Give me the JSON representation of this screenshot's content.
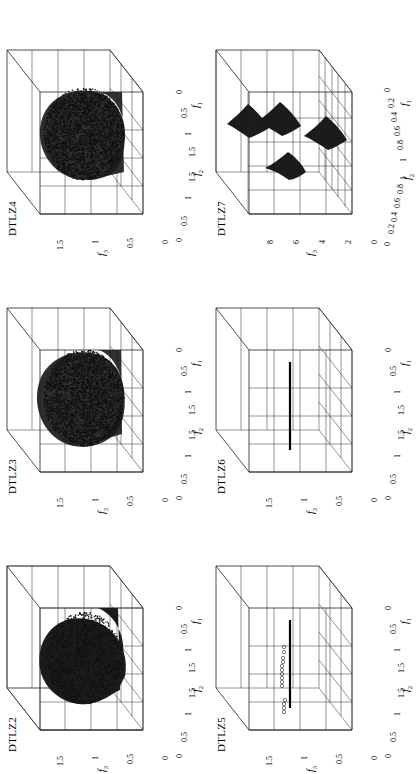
{
  "figure": {
    "layout": "2 rows x 3 columns of 3D scatter panels",
    "background": "#ffffff",
    "ink_color": "#111111"
  },
  "panels": [
    {
      "id": "dtlz2",
      "title": "DTLZ2",
      "row": 0,
      "col": 0,
      "axes": {
        "x": {
          "label": "f",
          "sub": "1",
          "ticks": [
            "0",
            "0.5",
            "1",
            "1.5"
          ],
          "range": [
            0,
            1.5
          ]
        },
        "y": {
          "label": "f",
          "sub": "2",
          "ticks": [
            "0",
            "0.5",
            "1",
            "1.5"
          ],
          "range": [
            0,
            1.5
          ]
        },
        "z": {
          "label": "f",
          "sub": "3",
          "ticks": [
            "0",
            "0.5",
            "1",
            "1.5"
          ],
          "range": [
            0,
            1.5
          ]
        }
      },
      "content": "dense-filled-spherical-front"
    },
    {
      "id": "dtlz3",
      "title": "DTLZ3",
      "row": 0,
      "col": 1,
      "axes": {
        "x": {
          "label": "f",
          "sub": "1",
          "ticks": [
            "0",
            "0.5",
            "1",
            "1.5"
          ],
          "range": [
            0,
            1.5
          ]
        },
        "y": {
          "label": "f",
          "sub": "2",
          "ticks": [
            "0",
            "0.5",
            "1",
            "1.5"
          ],
          "range": [
            0,
            1.5
          ]
        },
        "z": {
          "label": "f",
          "sub": "3",
          "ticks": [
            "0",
            "0.5",
            "1",
            "1.5"
          ],
          "range": [
            0,
            1.5
          ]
        }
      },
      "content": "scattered-spherical-front"
    },
    {
      "id": "dtlz4",
      "title": "DTLZ4",
      "row": 0,
      "col": 2,
      "axes": {
        "x": {
          "label": "f",
          "sub": "1",
          "ticks": [
            "0",
            "0.5",
            "1",
            "1.5"
          ],
          "range": [
            0,
            1.5
          ]
        },
        "y": {
          "label": "f",
          "sub": "2",
          "ticks": [
            "0",
            "0.5",
            "1",
            "1.5"
          ],
          "range": [
            0,
            1.5
          ]
        },
        "z": {
          "label": "f",
          "sub": "3",
          "ticks": [
            "0",
            "0.5",
            "1",
            "1.5"
          ],
          "range": [
            0,
            1.5
          ]
        }
      },
      "content": "scattered-spherical-front"
    },
    {
      "id": "dtlz5",
      "title": "DTLZ5",
      "row": 1,
      "col": 0,
      "axes": {
        "x": {
          "label": "f",
          "sub": "1",
          "ticks": [
            "0",
            "0.5",
            "1",
            "1.5"
          ],
          "range": [
            0,
            1.5
          ]
        },
        "y": {
          "label": "f",
          "sub": "2",
          "ticks": [
            "0",
            "0.5",
            "1",
            "1.5"
          ],
          "range": [
            0,
            1.5
          ]
        },
        "z": {
          "label": "f",
          "sub": "3",
          "ticks": [
            "0",
            "0.5",
            "1",
            "1.5"
          ],
          "range": [
            0,
            1.5
          ]
        }
      },
      "content": "degenerate-curve-plus-outlier-circles"
    },
    {
      "id": "dtlz6",
      "title": "DTLZ6",
      "row": 1,
      "col": 1,
      "axes": {
        "x": {
          "label": "f",
          "sub": "1",
          "ticks": [
            "0",
            "0.5",
            "1",
            "1.5"
          ],
          "range": [
            0,
            1.5
          ]
        },
        "y": {
          "label": "f",
          "sub": "2",
          "ticks": [
            "0",
            "0.5",
            "1",
            "1.5"
          ],
          "range": [
            0,
            1.5
          ]
        },
        "z": {
          "label": "f",
          "sub": "3",
          "ticks": [
            "0",
            "0.5",
            "1",
            "1.5"
          ],
          "range": [
            0,
            1.5
          ]
        }
      },
      "content": "degenerate-curve"
    },
    {
      "id": "dtlz7",
      "title": "DTLZ7",
      "row": 1,
      "col": 2,
      "axes": {
        "x": {
          "label": "f",
          "sub": "1",
          "ticks": [
            "0",
            "0.2",
            "0.4",
            "0.6",
            "0.8",
            "1"
          ],
          "range": [
            0,
            1
          ]
        },
        "y": {
          "label": "f",
          "sub": "2",
          "ticks": [
            "0",
            "0.2",
            "0.4",
            "0.6",
            "0.8",
            "1"
          ],
          "range": [
            0,
            1
          ]
        },
        "z": {
          "label": "f",
          "sub": "3",
          "ticks": [
            "0",
            "2",
            "4",
            "6",
            "8"
          ],
          "range": [
            0,
            8
          ]
        }
      },
      "content": "four-disconnected-patches"
    }
  ],
  "chart_data": {
    "type": "scatter",
    "title": "",
    "subplots": [
      {
        "name": "DTLZ2",
        "xlabel": "f1",
        "ylabel": "f2",
        "zlabel": "f3",
        "xlim": [
          0,
          1.5
        ],
        "ylim": [
          0,
          1.5
        ],
        "zlim": [
          0,
          1.5
        ],
        "xticks": [
          0,
          0.5,
          1,
          1.5
        ],
        "yticks": [
          0,
          0.5,
          1,
          1.5
        ],
        "zticks": [
          0,
          0.5,
          1,
          1.5
        ],
        "description": "Dense, solid-filled concave spherical Pareto front (unit octant sphere radius 1), points fully cover surface appearing as a solid black shell.",
        "point_count_estimate": 10000,
        "grid": true,
        "marker": "o"
      },
      {
        "name": "DTLZ3",
        "xlabel": "f1",
        "ylabel": "f2",
        "zlabel": "f3",
        "xlim": [
          0,
          1.5
        ],
        "ylim": [
          0,
          1.5
        ],
        "zlim": [
          0,
          1.5
        ],
        "xticks": [
          0,
          0.5,
          1,
          1.5
        ],
        "yticks": [
          0,
          0.5,
          1,
          1.5
        ],
        "zticks": [
          0,
          0.5,
          1,
          1.5
        ],
        "description": "Speckled concave spherical Pareto front (unit octant sphere radius 1) with visibly separated scatter points.",
        "point_count_estimate": 5000,
        "grid": true,
        "marker": "o"
      },
      {
        "name": "DTLZ4",
        "xlabel": "f1",
        "ylabel": "f2",
        "zlabel": "f3",
        "xlim": [
          0,
          1.5
        ],
        "ylim": [
          0,
          1.5
        ],
        "zlim": [
          0,
          1.5
        ],
        "xticks": [
          0,
          0.5,
          1,
          1.5
        ],
        "yticks": [
          0,
          0.5,
          1,
          1.5
        ],
        "zticks": [
          0,
          0.5,
          1,
          1.5
        ],
        "description": "Speckled concave spherical Pareto front, slightly sparser near the f3 apex than DTLZ3.",
        "point_count_estimate": 5000,
        "grid": true,
        "marker": "o"
      },
      {
        "name": "DTLZ5",
        "xlabel": "f1",
        "ylabel": "f2",
        "zlabel": "f3",
        "xlim": [
          0,
          1.5
        ],
        "ylim": [
          0,
          1.5
        ],
        "zlim": [
          0,
          1.5
        ],
        "xticks": [
          0,
          0.5,
          1,
          1.5
        ],
        "yticks": [
          0,
          0.5,
          1,
          1.5
        ],
        "zticks": [
          0,
          0.5,
          1,
          1.5
        ],
        "description": "Degenerate one-dimensional curve Pareto front drawn as a thick dark arc, plus a short trail of open-circle outlier markers above it toward high f3.",
        "outlier_marker_count": 14,
        "grid": true,
        "marker": "o"
      },
      {
        "name": "DTLZ6",
        "xlabel": "f1",
        "ylabel": "f2",
        "zlabel": "f3",
        "xlim": [
          0,
          1.5
        ],
        "ylim": [
          0,
          1.5
        ],
        "zlim": [
          0,
          1.5
        ],
        "xticks": [
          0,
          0.5,
          1,
          1.5
        ],
        "yticks": [
          0,
          0.5,
          1,
          1.5
        ],
        "zticks": [
          0,
          0.5,
          1,
          1.5
        ],
        "description": "Degenerate one-dimensional curve Pareto front only, drawn as a single thick dark arc; no outliers.",
        "grid": true,
        "marker": "o"
      },
      {
        "name": "DTLZ7",
        "xlabel": "f1",
        "ylabel": "f2",
        "zlabel": "f3",
        "xlim": [
          0,
          1
        ],
        "ylim": [
          0,
          1
        ],
        "zlim": [
          0,
          8
        ],
        "xticks": [
          0,
          0.2,
          0.4,
          0.6,
          0.8,
          1
        ],
        "yticks": [
          0,
          0.2,
          0.4,
          0.6,
          0.8,
          1
        ],
        "zticks": [
          0,
          2,
          4,
          6,
          8
        ],
        "description": "Four disconnected solid patches (diamond-like lobes) of the Pareto front, lying at roughly f3 = 3 to 6, arranged in a 2x2 pattern over the f1-f2 plane.",
        "patch_count": 4,
        "grid": true,
        "marker": "o"
      }
    ]
  }
}
